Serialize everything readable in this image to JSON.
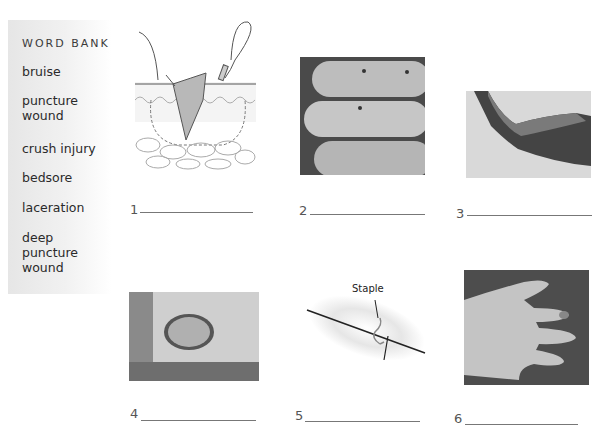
{
  "word_bank": {
    "title": "WORD BANK",
    "items": [
      "bruise",
      "puncture\nwound",
      "crush injury",
      "bedsore",
      "laceration",
      "deep\npuncture\nwound"
    ]
  },
  "figures": [
    {
      "number": "1",
      "description": "drawing of deep puncture wound through skin layers with suture"
    },
    {
      "number": "2",
      "description": "photo of fingers with small puncture marks"
    },
    {
      "number": "3",
      "description": "photo of upper arm with bruise"
    },
    {
      "number": "4",
      "description": "photo of bedsore with ruler"
    },
    {
      "number": "5",
      "description": "drawing of laceration closed with staple"
    },
    {
      "number": "6",
      "description": "photo of hand with crushed fingertip"
    }
  ],
  "staple_label": "Staple"
}
